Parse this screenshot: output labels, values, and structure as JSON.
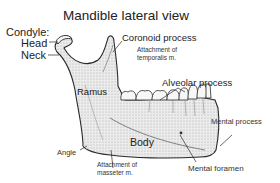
{
  "diagram": {
    "title": "Mandible lateral view",
    "labels": {
      "condyle": "Condyle:",
      "head": "Head",
      "neck": "Neck",
      "coronoid_process": "Coronoid process",
      "temporalis_line1": "Attachment of",
      "temporalis_line2": "temporalis m.",
      "ramus": "Ramus",
      "alveolar_process": "Alveolar process",
      "mental_process": "Mental process",
      "body": "Body",
      "angle": "Angle",
      "masseter_line1": "Attachment of",
      "masseter_line2": "masseter m.",
      "mental_foramen": "Mental foramen"
    },
    "colors": {
      "outline": "#2a2a2a",
      "bone_fill": "#e4e4e4",
      "teeth_fill": "#f7f7f7",
      "background": "#ffffff"
    }
  }
}
